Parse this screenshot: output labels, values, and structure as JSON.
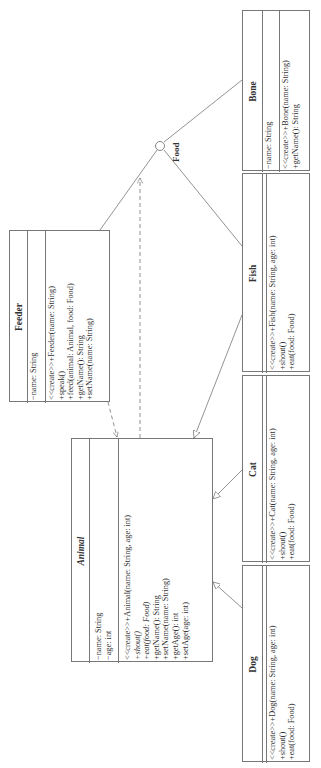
{
  "diagram": {
    "type": "UML class diagram",
    "orientation": "rotated 90 degrees counter-clockwise (text reads bottom-to-top)",
    "interface_label": "Food",
    "classes": [
      {
        "id": "bone",
        "name": "Bone",
        "abstract": false,
        "attributes": [
          "−name: String"
        ],
        "operations": [
          "<<create>>+Bone(name: String)",
          "+getName(): String"
        ]
      },
      {
        "id": "fish",
        "name": "Fish",
        "abstract": false,
        "attributes": [],
        "operations": [
          "<<create>>+Fish(name: String, age: int)",
          "+shout()",
          "+eat(food: Food)"
        ]
      },
      {
        "id": "cat",
        "name": "Cat",
        "abstract": false,
        "attributes": [],
        "operations": [
          "<<create>>+Cat(name: String, age: int)",
          "+shout()",
          "+eat(food: Food)"
        ]
      },
      {
        "id": "dog",
        "name": "Dog",
        "abstract": false,
        "attributes": [],
        "operations": [
          "<<create>>+Dog(name: String, age: int)",
          "+shout()",
          "+eat(food: Food)"
        ]
      },
      {
        "id": "feeder",
        "name": "Feeder",
        "abstract": false,
        "attributes": [
          "−name: String"
        ],
        "operations": [
          "<<create>>+Feeder(name: String)",
          "+speak()",
          "+feed(animal: Animal, food: Food)",
          "+getName(): String",
          "+setName(name: String)"
        ]
      },
      {
        "id": "animal",
        "name": "Animal",
        "abstract": true,
        "attributes": [
          "−name: String",
          "−age: int"
        ],
        "operations": [
          "<<create>>+Animal(name: String, age: int)",
          "+shout()",
          "+eat(food: Food)",
          "+getName(): String",
          "+setName(name: String)",
          "+getAge(): int",
          "+setAge(age: int)"
        ],
        "italic_operations": [
          1,
          2
        ]
      }
    ],
    "relationships": [
      {
        "from": "Bone",
        "to": "Food",
        "type": "realization (lollipop)"
      },
      {
        "from": "Fish",
        "to": "Food",
        "type": "realization (lollipop)"
      },
      {
        "from": "Feeder",
        "to": "Food",
        "type": "usage"
      },
      {
        "from": "Animal",
        "to": "Food",
        "type": "dependency (dashed)"
      },
      {
        "from": "Feeder",
        "to": "Animal",
        "type": "dependency (dashed)"
      },
      {
        "from": "Fish",
        "to": "Animal",
        "type": "generalization"
      },
      {
        "from": "Cat",
        "to": "Animal",
        "type": "generalization"
      },
      {
        "from": "Dog",
        "to": "Animal",
        "type": "generalization"
      }
    ],
    "colors": {
      "line": "#777777",
      "text": "#333333",
      "background": "#ffffff"
    }
  }
}
